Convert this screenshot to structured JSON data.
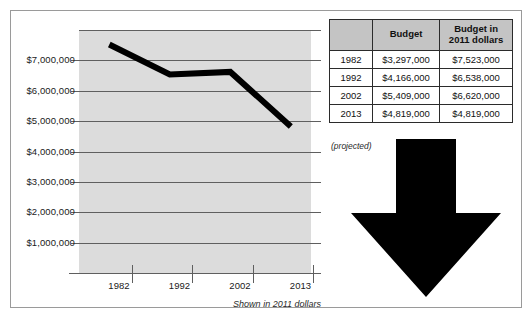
{
  "chart_data": {
    "type": "line",
    "title": "",
    "xlabel": "",
    "ylabel": "",
    "categories": [
      "1982",
      "1992",
      "2002",
      "2013"
    ],
    "values": [
      7523000,
      6538000,
      6620000,
      4819000
    ],
    "series": [
      {
        "name": "Budget in 2011 dollars",
        "values": [
          7523000,
          6538000,
          6620000,
          4819000
        ]
      }
    ],
    "ylim": [
      0,
      8000000
    ],
    "ytick_labels": [
      "$1,000,000",
      "$2,000,000",
      "$3,000,000",
      "$4,000,000",
      "$5,000,000",
      "$6,000,000",
      "$7,000,000"
    ],
    "ytick_values": [
      1000000,
      2000000,
      3000000,
      4000000,
      5000000,
      6000000,
      7000000
    ],
    "xtick_labels": [
      "1982",
      "1992",
      "2002",
      "2013"
    ],
    "grid": true,
    "legend": "none",
    "annotation": "Shown in 2011 dollars",
    "line_color": "#000000",
    "plot_background": "#dcdcdc"
  },
  "chart": {
    "caption": "Shown in 2011 dollars"
  },
  "table": {
    "headers": [
      "",
      "Budget",
      "Budget in\n2011 dollars"
    ],
    "header_col_blank": "",
    "header_budget": "Budget",
    "header_budget_2011_line1": "Budget in",
    "header_budget_2011_line2": "2011 dollars",
    "rows": [
      {
        "year": "1982",
        "budget": "$3,297,000",
        "budget_2011": "$7,523,000"
      },
      {
        "year": "1992",
        "budget": "$4,166,000",
        "budget_2011": "$6,538,000"
      },
      {
        "year": "2002",
        "budget": "$5,409,000",
        "budget_2011": "$6,620,000"
      },
      {
        "year": "2013",
        "budget": "$4,819,000",
        "budget_2011": "$4,819,000"
      }
    ],
    "projected_note": "(projected)"
  },
  "arrow": {
    "direction": "down",
    "color": "#000000"
  },
  "colors": {
    "frame_border": "#9a9a9a",
    "plot_background": "#dcdcdc",
    "gridline": "#5f5f5f",
    "line": "#000000",
    "table_header_bg": "#c4c4c4",
    "table_row_shade": "#d7d7d7",
    "table_border": "#2b2b2b"
  }
}
